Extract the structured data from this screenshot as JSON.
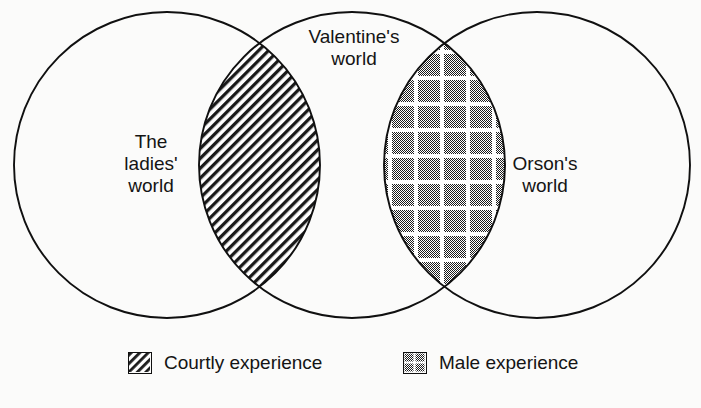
{
  "diagram": {
    "type": "venn",
    "title": "",
    "background_color": "#fbfbfa",
    "stroke_color": "#101010",
    "sets": [
      {
        "id": "ladies",
        "label": "The\nladies'\nworld",
        "label_lines": [
          "The",
          "ladies'",
          "world"
        ],
        "cx": 167,
        "cy": 165,
        "r": 153
      },
      {
        "id": "valentine",
        "label": "Valentine's\nworld",
        "label_lines": [
          "Valentine's",
          "world"
        ],
        "cx": 352,
        "cy": 165,
        "r": 153
      },
      {
        "id": "orson",
        "label": "Orson's\nworld",
        "label_lines": [
          "Orson's",
          "world"
        ],
        "cx": 537,
        "cy": 165,
        "r": 153
      }
    ],
    "intersections": [
      {
        "id": "courtly",
        "between": [
          "ladies",
          "valentine"
        ],
        "fill": "diagonal-hatch",
        "fill_color": "#1a1a1a"
      },
      {
        "id": "male",
        "between": [
          "valentine",
          "orson"
        ],
        "fill": "checkered-grid",
        "fill_color": "#4a4a4a"
      }
    ]
  },
  "legend": {
    "items": [
      {
        "id": "courtly",
        "swatch": "diagonal-hatch-swatch",
        "label": "Courtly experience"
      },
      {
        "id": "male",
        "swatch": "checkered-grid-swatch",
        "label": "Male experience"
      }
    ]
  }
}
